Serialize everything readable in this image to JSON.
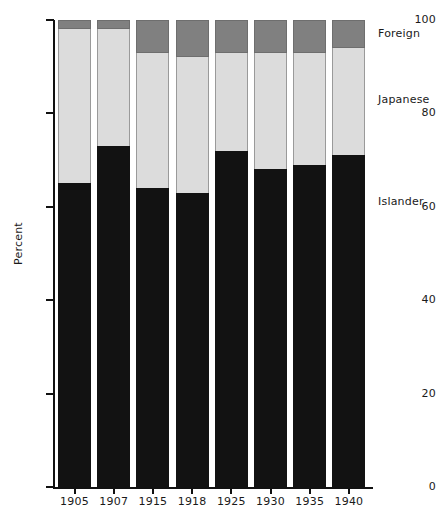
{
  "chart_data": {
    "type": "bar",
    "subtype": "stacked-100-percent",
    "title": "",
    "xlabel": "",
    "ylabel": "Percent",
    "ylim": [
      0,
      100
    ],
    "yticks": [
      0,
      20,
      40,
      60,
      80,
      100
    ],
    "grid": false,
    "legend_position": "right",
    "categories": [
      "1905",
      "1907",
      "1915",
      "1918",
      "1925",
      "1930",
      "1935",
      "1940"
    ],
    "series": [
      {
        "name": "Islander",
        "color": "#121212",
        "values": [
          65,
          73,
          64,
          63,
          72,
          68,
          69,
          71
        ]
      },
      {
        "name": "Japanese",
        "color": "#dcdcdc",
        "values": [
          33,
          25,
          29,
          29,
          21,
          25,
          24,
          23
        ]
      },
      {
        "name": "Foreign",
        "color": "#808080",
        "values": [
          2,
          2,
          7,
          8,
          7,
          7,
          7,
          6
        ]
      }
    ],
    "legend": [
      {
        "label": "Foreign",
        "color": "#808080"
      },
      {
        "label": "Japanese",
        "color": "#dcdcdc"
      },
      {
        "label": "Islander",
        "color": "#121212"
      }
    ],
    "axis_color": "#111111"
  }
}
